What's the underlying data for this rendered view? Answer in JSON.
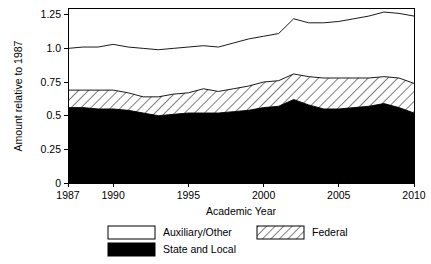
{
  "chart_data": {
    "type": "area",
    "stacked": true,
    "title": "",
    "xlabel": "Academic Year",
    "ylabel": "Amount relative to 1987",
    "xlim": [
      1987,
      2010
    ],
    "ylim": [
      0,
      1.3
    ],
    "xticks": [
      1987,
      1990,
      1995,
      2000,
      2005,
      2010
    ],
    "xtick_labels": [
      "1987",
      "1990",
      "1995",
      "2000",
      "2005",
      "2010"
    ],
    "yticks": [
      0,
      0.25,
      0.5,
      0.75,
      1.0,
      1.25
    ],
    "ytick_labels": [
      "0",
      "0.25",
      "0.5",
      "0.75",
      "1.0",
      "1.25"
    ],
    "grid": false,
    "legend_position": "below",
    "x": [
      1987,
      1988,
      1989,
      1990,
      1991,
      1992,
      1993,
      1994,
      1995,
      1996,
      1997,
      1998,
      1999,
      2000,
      2001,
      2002,
      2003,
      2004,
      2005,
      2006,
      2007,
      2008,
      2009,
      2010
    ],
    "series": [
      {
        "name": "State and Local",
        "fill": "black",
        "values": [
          0.56,
          0.56,
          0.55,
          0.55,
          0.54,
          0.52,
          0.5,
          0.51,
          0.52,
          0.52,
          0.52,
          0.53,
          0.54,
          0.56,
          0.57,
          0.62,
          0.58,
          0.55,
          0.55,
          0.56,
          0.57,
          0.59,
          0.56,
          0.52
        ]
      },
      {
        "name": "Federal",
        "fill": "hatched",
        "values": [
          0.13,
          0.13,
          0.14,
          0.14,
          0.13,
          0.12,
          0.14,
          0.15,
          0.15,
          0.18,
          0.16,
          0.17,
          0.18,
          0.19,
          0.19,
          0.19,
          0.21,
          0.23,
          0.23,
          0.22,
          0.21,
          0.2,
          0.22,
          0.22
        ]
      },
      {
        "name": "Auxiliary/Other",
        "fill": "white",
        "values": [
          0.31,
          0.32,
          0.32,
          0.34,
          0.34,
          0.36,
          0.35,
          0.34,
          0.34,
          0.32,
          0.33,
          0.34,
          0.35,
          0.34,
          0.35,
          0.41,
          0.4,
          0.41,
          0.42,
          0.44,
          0.46,
          0.48,
          0.48,
          0.5
        ]
      }
    ],
    "cumulative_tops": {
      "state_and_local": [
        0.56,
        0.56,
        0.55,
        0.55,
        0.54,
        0.52,
        0.5,
        0.51,
        0.52,
        0.52,
        0.52,
        0.53,
        0.54,
        0.56,
        0.57,
        0.62,
        0.58,
        0.55,
        0.55,
        0.56,
        0.57,
        0.59,
        0.56,
        0.52
      ],
      "federal": [
        0.69,
        0.69,
        0.69,
        0.69,
        0.67,
        0.64,
        0.64,
        0.66,
        0.67,
        0.7,
        0.68,
        0.7,
        0.72,
        0.75,
        0.76,
        0.81,
        0.79,
        0.78,
        0.78,
        0.78,
        0.78,
        0.79,
        0.78,
        0.74
      ],
      "total": [
        1.0,
        1.01,
        1.01,
        1.03,
        1.01,
        1.0,
        0.99,
        1.0,
        1.01,
        1.02,
        1.01,
        1.04,
        1.07,
        1.09,
        1.11,
        1.22,
        1.19,
        1.19,
        1.2,
        1.22,
        1.24,
        1.27,
        1.26,
        1.24
      ]
    },
    "legend": [
      {
        "label": "Auxiliary/Other",
        "fill": "white"
      },
      {
        "label": "Federal",
        "fill": "hatched"
      },
      {
        "label": "State and Local",
        "fill": "black"
      }
    ]
  },
  "colors": {
    "state_and_local": "#000000",
    "federal_hatch": "#000000",
    "auxiliary_other": "#ffffff",
    "axis": "#000000",
    "background": "#ffffff"
  }
}
